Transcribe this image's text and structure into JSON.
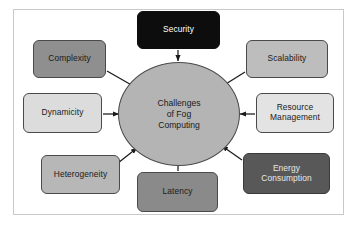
{
  "diagram": {
    "title": "Challenges of Fog Computing",
    "frame": {
      "border_color": "#c9c9c9",
      "background": "#ffffff"
    },
    "center": {
      "id": "challenges-of-fog-computing",
      "label": "Challenges\nof Fog\nComputing",
      "fill": "#b4b4b4",
      "text_color": "#1a1a1a",
      "stroke": "#4a4a4a",
      "x": 118,
      "y": 62,
      "width": 122,
      "height": 104
    },
    "edge_color": "#1a1a1a",
    "nodes": [
      {
        "id": "security",
        "label": "Security",
        "fill": "#0d0d0d",
        "text_color": "#ffffff",
        "stroke": "#0d0d0d",
        "x": 137,
        "y": 11,
        "width": 83,
        "height": 38,
        "arrow_from": "security",
        "arrow_to": "center"
      },
      {
        "id": "complexity",
        "label": "Complexity",
        "fill": "#8f8f8f",
        "text_color": "#1a1a1a",
        "stroke": "#4a4a4a",
        "x": 33,
        "y": 40,
        "width": 73,
        "height": 38,
        "arrow_from": "complexity",
        "arrow_to": "center"
      },
      {
        "id": "scalability",
        "label": "Scalability",
        "fill": "#bdbdbd",
        "text_color": "#1a1a1a",
        "stroke": "#4a4a4a",
        "x": 246,
        "y": 40,
        "width": 82,
        "height": 38,
        "arrow_from": "scalability",
        "arrow_to": "center"
      },
      {
        "id": "dynamicity",
        "label": "Dynamicity",
        "fill": "#dcdcdc",
        "text_color": "#1a1a1a",
        "stroke": "#4a4a4a",
        "x": 23,
        "y": 93,
        "width": 79,
        "height": 40,
        "arrow_from": "dynamicity",
        "arrow_to": "center"
      },
      {
        "id": "resource-management",
        "label": "Resource\nManagement",
        "fill": "#e3e3e3",
        "text_color": "#1a1a1a",
        "stroke": "#4a4a4a",
        "x": 256,
        "y": 93,
        "width": 78,
        "height": 40,
        "arrow_from": "resource-management",
        "arrow_to": "center"
      },
      {
        "id": "heterogeneity",
        "label": "Heterogeneity",
        "fill": "#b7b7b7",
        "text_color": "#1a1a1a",
        "stroke": "#4a4a4a",
        "x": 41,
        "y": 155,
        "width": 79,
        "height": 39,
        "arrow_from": "heterogeneity",
        "arrow_to": "center"
      },
      {
        "id": "latency",
        "label": "Latency",
        "fill": "#8a8a8a",
        "text_color": "#1a1a1a",
        "stroke": "#4a4a4a",
        "x": 137,
        "y": 172,
        "width": 81,
        "height": 40,
        "arrow_from": "latency",
        "arrow_to": "center"
      },
      {
        "id": "energy-consumption",
        "label": "Energy\nConsumption",
        "fill": "#585858",
        "text_color": "#e8e8e8",
        "stroke": "#3a3a3a",
        "x": 243,
        "y": 153,
        "width": 87,
        "height": 41,
        "arrow_from": "energy-consumption",
        "arrow_to": "center"
      }
    ]
  }
}
